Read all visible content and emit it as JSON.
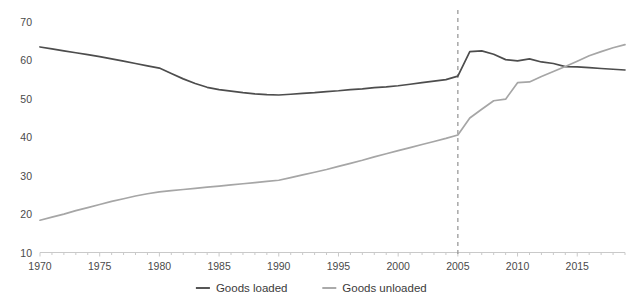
{
  "chart_data": {
    "type": "line",
    "title": "",
    "subtitle": "",
    "xlabel": "",
    "ylabel": "",
    "xlim": [
      1970,
      2019
    ],
    "ylim": [
      10,
      70
    ],
    "ytick_step": 10,
    "xtick_step": 5,
    "minor_xtick_step": 1,
    "grid": false,
    "legend_position": "bottom-center",
    "x": [
      1970,
      1971,
      1972,
      1973,
      1974,
      1975,
      1976,
      1977,
      1978,
      1979,
      1980,
      1981,
      1982,
      1983,
      1984,
      1985,
      1986,
      1987,
      1988,
      1989,
      1990,
      1991,
      1992,
      1993,
      1994,
      1995,
      1996,
      1997,
      1998,
      1999,
      2000,
      2001,
      2002,
      2003,
      2004,
      2005,
      2006,
      2007,
      2008,
      2009,
      2010,
      2011,
      2012,
      2013,
      2014,
      2015,
      2016,
      2017,
      2018,
      2019
    ],
    "yticks": [
      10,
      20,
      30,
      40,
      50,
      60,
      70
    ],
    "xticks": [
      1970,
      1975,
      1980,
      1985,
      1990,
      1995,
      2000,
      2005,
      2010,
      2015
    ],
    "xtick_labels": [
      "1970",
      "1975",
      "1980",
      "1985",
      "1990",
      "1995",
      "2000",
      "2005",
      "2010",
      "2015"
    ],
    "ytick_labels": [
      "10",
      "20",
      "30",
      "40",
      "50",
      "60",
      "70"
    ],
    "series": [
      {
        "name": "Goods loaded",
        "color": "#4d4d4d",
        "values": [
          63.5,
          63.0,
          62.5,
          62.0,
          61.5,
          61.0,
          60.4,
          59.8,
          59.2,
          58.6,
          58.0,
          56.6,
          55.2,
          54.0,
          53.0,
          52.4,
          52.0,
          51.6,
          51.3,
          51.1,
          51.0,
          51.2,
          51.4,
          51.6,
          51.9,
          52.1,
          52.4,
          52.6,
          52.9,
          53.1,
          53.4,
          53.8,
          54.2,
          54.6,
          55.0,
          55.9,
          62.3,
          62.5,
          61.6,
          60.2,
          59.9,
          60.4,
          59.6,
          59.2,
          58.4,
          58.3,
          58.1,
          57.9,
          57.7,
          57.5
        ]
      },
      {
        "name": "Goods unloaded",
        "color": "#a6a6a6",
        "values": [
          18.4,
          19.2,
          20.0,
          20.9,
          21.7,
          22.5,
          23.3,
          24.0,
          24.7,
          25.3,
          25.8,
          26.1,
          26.4,
          26.7,
          27.0,
          27.3,
          27.6,
          27.9,
          28.2,
          28.5,
          28.8,
          29.5,
          30.2,
          30.9,
          31.6,
          32.4,
          33.2,
          34.0,
          34.9,
          35.7,
          36.5,
          37.3,
          38.1,
          38.9,
          39.7,
          40.6,
          45.0,
          47.3,
          49.5,
          49.9,
          54.2,
          54.4,
          55.8,
          57.1,
          58.4,
          59.8,
          61.2,
          62.3,
          63.3,
          64.1
        ]
      }
    ],
    "annotations": [
      {
        "type": "vertical-dashed-line",
        "x": 2005,
        "color": "#9a9a9a",
        "label": ""
      }
    ],
    "legend": [
      {
        "label": "Goods loaded",
        "color": "#4d4d4d"
      },
      {
        "label": "Goods unloaded",
        "color": "#a6a6a6"
      }
    ]
  },
  "axis": {
    "y_ticks": [
      "70",
      "60",
      "50",
      "40",
      "30",
      "20",
      "10"
    ],
    "x_ticks": [
      "1970",
      "1975",
      "1980",
      "1985",
      "1990",
      "1995",
      "2000",
      "2005",
      "2010",
      "2015"
    ]
  },
  "legend": {
    "items": [
      {
        "label": "Goods loaded"
      },
      {
        "label": "Goods unloaded"
      }
    ]
  }
}
